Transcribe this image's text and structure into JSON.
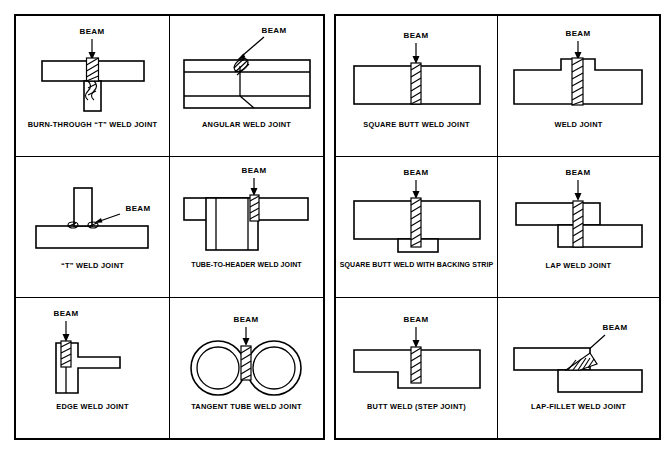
{
  "figure": {
    "type": "technical-illustration-grid",
    "beam_label": "BEAM",
    "tables": [
      {
        "id": "left-table",
        "rows": [
          [
            {
              "id": "burn-through-t-weld-joint",
              "caption": "BURN-THROUGH “T” WELD JOINT",
              "beam_direction": "vertical-down"
            },
            {
              "id": "angular-weld-joint",
              "caption": "ANGULAR WELD JOINT",
              "beam_direction": "angled"
            }
          ],
          [
            {
              "id": "t-weld-joint",
              "caption": "“T” WELD JOINT",
              "beam_direction": "angled"
            },
            {
              "id": "tube-to-header-weld-joint",
              "caption": "TUBE-TO-HEADER WELD JOINT",
              "beam_direction": "vertical-down"
            }
          ],
          [
            {
              "id": "edge-weld-joint",
              "caption": "EDGE WELD JOINT",
              "beam_direction": "vertical-down"
            },
            {
              "id": "tangent-tube-weld-joint",
              "caption": "TANGENT TUBE WELD JOINT",
              "beam_direction": "vertical-down"
            }
          ]
        ]
      },
      {
        "id": "right-table",
        "rows": [
          [
            {
              "id": "square-butt-weld-joint",
              "caption": "SQUARE BUTT WELD JOINT",
              "beam_direction": "vertical-down"
            },
            {
              "id": "weld-joint",
              "caption": "WELD JOINT",
              "beam_direction": "vertical-down"
            }
          ],
          [
            {
              "id": "square-butt-weld-with-backing-strip",
              "caption": "SQUARE BUTT WELD WITH BACKING STRIP",
              "beam_direction": "vertical-down"
            },
            {
              "id": "lap-weld-joint",
              "caption": "LAP WELD JOINT",
              "beam_direction": "vertical-down"
            }
          ],
          [
            {
              "id": "butt-weld-step-joint",
              "caption": "BUTT WELD (STEP JOINT)",
              "beam_direction": "vertical-down"
            },
            {
              "id": "lap-fillet-weld-joint",
              "caption": "LAP-FILLET WELD JOINT",
              "beam_direction": "angled"
            }
          ]
        ]
      }
    ]
  },
  "colors": {
    "ink": "#000000",
    "paper": "#ffffff"
  }
}
